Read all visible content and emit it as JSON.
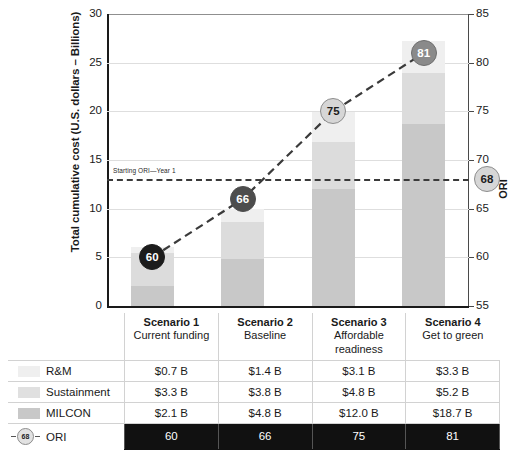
{
  "chart_data": {
    "type": "bar",
    "title": "",
    "xlabel": "",
    "ylabel": "Total cumulative cost (U.S. dollars – Billions)",
    "y2label": "ORI",
    "ylim": [
      0,
      30
    ],
    "y2lim": [
      55,
      85
    ],
    "yticks": [
      "0",
      "5",
      "10",
      "15",
      "20",
      "25",
      "30"
    ],
    "ytick_values": [
      0,
      5,
      10,
      15,
      20,
      25,
      30
    ],
    "y2ticks": [
      "55",
      "60",
      "65",
      "70",
      "75",
      "80",
      "85"
    ],
    "y2tick_values": [
      55,
      60,
      65,
      70,
      75,
      80,
      85
    ],
    "grid": true,
    "legend_position": "table",
    "categories": [
      "Scenario 1",
      "Scenario 2",
      "Scenario 3",
      "Scenario 4"
    ],
    "category_subtitles": [
      "Current funding",
      "Baseline",
      "Affordable readiness",
      "Get to green"
    ],
    "series": [
      {
        "name": "MILCON",
        "values": [
          2.1,
          4.8,
          12.0,
          18.7
        ],
        "color": "#c8c8c8"
      },
      {
        "name": "Sustainment",
        "values": [
          3.3,
          3.8,
          4.8,
          5.2
        ],
        "color": "#dcdcdc"
      },
      {
        "name": "R&M",
        "values": [
          0.7,
          1.4,
          3.1,
          3.3
        ],
        "color": "#efefef"
      }
    ],
    "ori_series": {
      "name": "ORI",
      "values": [
        60,
        66,
        75,
        81
      ],
      "axis": "secondary",
      "line_style": "dashed",
      "marker": "circle"
    },
    "reference_line": {
      "label": "Starting ORI—Year 1",
      "value": 68,
      "axis": "secondary",
      "line_style": "dashed",
      "end_marker_label": "68"
    }
  },
  "axes": {
    "left_title": "Total cumulative cost (U.S. dollars – Billions)",
    "right_title": "ORI",
    "left_ticks": [
      "30",
      "25",
      "20",
      "15",
      "10",
      "5",
      "0"
    ],
    "right_ticks": [
      "85",
      "80",
      "75",
      "70",
      "65",
      "60",
      "55"
    ]
  },
  "annotations": {
    "starting_ori": "Starting ORI—Year 1",
    "ori_axis_marker": "68",
    "ori_markers": [
      "60",
      "66",
      "75",
      "81"
    ]
  },
  "table": {
    "header_blank": "",
    "columns": [
      {
        "name": "Scenario 1",
        "subtitle": "Current funding"
      },
      {
        "name": "Scenario 2",
        "subtitle": "Baseline"
      },
      {
        "name": "Scenario 3",
        "subtitle": "Affordable readiness"
      },
      {
        "name": "Scenario 4",
        "subtitle": "Get to green"
      }
    ],
    "rows": [
      {
        "label": "R&M",
        "swatch": "rm",
        "values": [
          "$0.7 B",
          "$1.4 B",
          "$3.1 B",
          "$3.3 B"
        ]
      },
      {
        "label": "Sustainment",
        "swatch": "sus",
        "values": [
          "$3.3 B",
          "$3.8 B",
          "$4.8 B",
          "$5.2 B"
        ]
      },
      {
        "label": "MILCON",
        "swatch": "mil",
        "values": [
          "$2.1 B",
          "$4.8 B",
          "$12.0 B",
          "$18.7 B"
        ]
      },
      {
        "label": "ORI",
        "swatch": "ori",
        "values": [
          "60",
          "66",
          "75",
          "81"
        ]
      }
    ],
    "ori_legend_marker": "68"
  },
  "colors": {
    "milcon": "#c8c8c8",
    "sustainment": "#dcdcdc",
    "rm": "#efefef",
    "ori_line": "#3a3a3a",
    "ori_row_bg": "#111111",
    "grid": "#dedede",
    "axis": "#1a1a1a"
  }
}
